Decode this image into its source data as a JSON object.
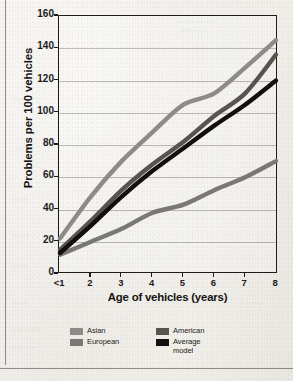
{
  "chart_data": {
    "type": "line",
    "title": "",
    "xlabel": "Age of vehicles (years)",
    "ylabel": "Problems per 100 vehicles",
    "x": [
      "<1",
      "2",
      "3",
      "4",
      "5",
      "6",
      "7",
      "8"
    ],
    "xticklabels": [
      "<1",
      "2",
      "3",
      "4",
      "5",
      "6",
      "7",
      "8"
    ],
    "yticklabels": [
      "0",
      "20",
      "40",
      "60",
      "80",
      "100",
      "120",
      "140",
      "160"
    ],
    "yticks": [
      0,
      20,
      40,
      60,
      80,
      100,
      120,
      140,
      160
    ],
    "ylim": [
      0,
      160
    ],
    "grid": "horizontal",
    "legend_position": "bottom",
    "series": [
      {
        "name": "Asian",
        "color": "#8e8c88",
        "values": [
          22,
          48,
          70,
          88,
          105,
          112,
          128,
          145
        ]
      },
      {
        "name": "American",
        "color": "#57544f",
        "values": [
          15,
          33,
          52,
          68,
          82,
          98,
          112,
          136
        ]
      },
      {
        "name": "European",
        "color": "#7a7874",
        "values": [
          12,
          20,
          28,
          38,
          43,
          52,
          60,
          70
        ]
      },
      {
        "name": "Average model",
        "color": "#100f0e",
        "values": [
          13,
          30,
          48,
          64,
          78,
          92,
          105,
          120
        ]
      }
    ]
  },
  "legend": {
    "entries": [
      {
        "label": "Asian",
        "color": "#8e8c88"
      },
      {
        "label": "American",
        "color": "#57544f"
      },
      {
        "label": "European",
        "color": "#7a7874"
      },
      {
        "label": "Average\nmodel",
        "color": "#100f0e"
      }
    ]
  },
  "page": {
    "ghost_text": [
      "the vehicles of",
      "number of",
      "reported",
      "per 100",
      "survey",
      "quality",
      "owners",
      "of the",
      "study results",
      "reliability",
      "brand"
    ]
  }
}
